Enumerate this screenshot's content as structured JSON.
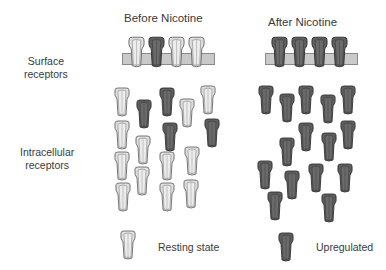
{
  "headers": {
    "before": "Before Nicotine",
    "after": "After Nicotine"
  },
  "row_labels": {
    "surface": [
      "Surface",
      "receptors"
    ],
    "intracellular": [
      "Intracellular",
      "receptors"
    ]
  },
  "legend": {
    "resting": "Resting state",
    "upregulated": "Upregulated"
  },
  "colors": {
    "resting_fill": "#dcdcdc",
    "upregulated_fill": "#5a5a5a",
    "membrane": "#c9c9c9",
    "outline": "#555555"
  },
  "surface_before": [
    "resting",
    "upregulated",
    "resting",
    "resting"
  ],
  "surface_after": [
    "upregulated",
    "upregulated",
    "upregulated",
    "upregulated"
  ],
  "intracellular_before_counts": {
    "resting": 13,
    "upregulated": 3
  },
  "intracellular_after_counts": {
    "resting": 0,
    "upregulated": 15
  }
}
